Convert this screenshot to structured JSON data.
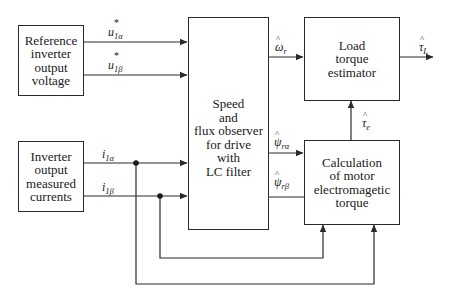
{
  "blocks": {
    "reference_voltage": {
      "label": "Reference\ninverter\noutput\nvoltage"
    },
    "measured_currents": {
      "label": "Inverter\noutput\nmeasured\ncurrents"
    },
    "observer": {
      "label": "Speed\nand\nflux observer\nfor drive\nwith\nLC filter"
    },
    "load_torque": {
      "label": "Load\ntorque\nestimator"
    },
    "em_torque": {
      "label": "Calculation\nof motor\nelectromagetic\ntorque"
    }
  },
  "signals": {
    "u1a": {
      "base": "u",
      "sub": "1α",
      "mark": "*"
    },
    "u1b": {
      "base": "u",
      "sub": "1β",
      "mark": "*"
    },
    "i1a": {
      "base": "i",
      "sub": "1α"
    },
    "i1b": {
      "base": "i",
      "sub": "1β"
    },
    "omega_r": {
      "base": "ω",
      "sub": "r",
      "mark": "^"
    },
    "psi_ra": {
      "base": "ψ",
      "sub": "rα",
      "mark": "^"
    },
    "psi_rb": {
      "base": "ψ",
      "sub": "rβ",
      "mark": "^"
    },
    "tau_e": {
      "base": "τ",
      "sub": "e",
      "mark": "^"
    },
    "tau_L": {
      "base": "τ",
      "sub": "L",
      "mark": "^"
    }
  },
  "colors": {
    "line": "#2a2a2a",
    "background": "#ffffff"
  }
}
